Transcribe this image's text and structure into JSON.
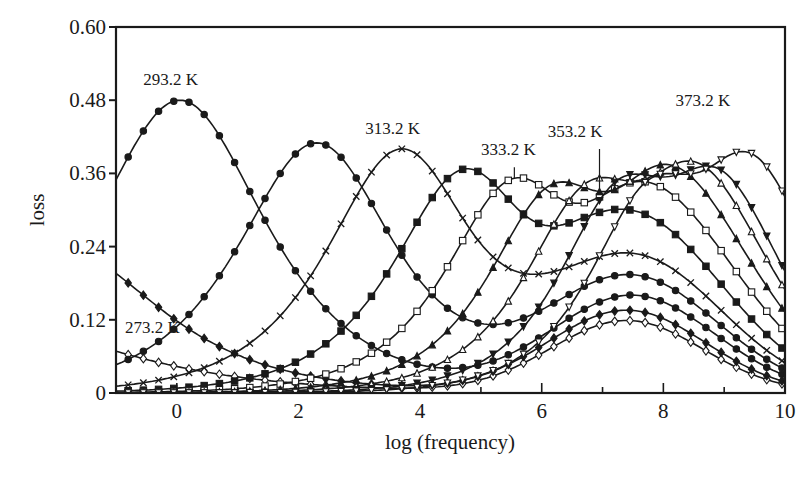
{
  "chart_data": {
    "type": "line",
    "title": "",
    "xlabel": "log (frequency)",
    "ylabel": "loss",
    "xlim": [
      -1,
      10
    ],
    "ylim": [
      0,
      0.6
    ],
    "xticks": [
      0,
      2,
      4,
      6,
      8,
      10
    ],
    "xtick_labels": [
      "0",
      "2",
      "4",
      "6",
      "8",
      "10"
    ],
    "yticks": [
      0,
      0.12,
      0.24,
      0.36,
      0.48,
      0.6
    ],
    "ytick_labels": [
      "0",
      "0.12",
      "0.24",
      "0.36",
      "0.48",
      "0.60"
    ],
    "grid": false,
    "legend": "none (curves labeled inline)",
    "annotations": [
      {
        "text": "273.2 K",
        "x": -0.85,
        "y": 0.098
      },
      {
        "text": "293.2 K",
        "x": -0.55,
        "y": 0.505
      },
      {
        "text": "313.2 K",
        "x": 3.1,
        "y": 0.425
      },
      {
        "text": "333.2 K",
        "x": 5.0,
        "y": 0.39
      },
      {
        "text": "353.2 K",
        "x": 6.1,
        "y": 0.42
      },
      {
        "text": "373.2 K",
        "x": 8.2,
        "y": 0.47
      }
    ],
    "series_model": "each curve = primary relaxation peak (height h1 at log f = p1, width w1) + secondary broad peak (height h2 at log f = p2, width w2); values sampled on x",
    "x": [
      -1,
      -0.5,
      0,
      0.5,
      1,
      1.5,
      2,
      2.5,
      3,
      3.5,
      4,
      4.5,
      5,
      5.5,
      6,
      6.5,
      7,
      7.5,
      8,
      8.5,
      9,
      9.5,
      10
    ],
    "series": [
      {
        "name": "273.2 K",
        "marker": "diamond-open",
        "p1": -3.0,
        "h1": 0.11,
        "w1": 1.9,
        "p2": 7.4,
        "h2": 0.118,
        "w2": 1.25
      },
      {
        "name": "283.2 K",
        "marker": "diamond-filled",
        "p1": -1.9,
        "h1": 0.235,
        "w1": 1.45,
        "p2": 7.4,
        "h2": 0.135,
        "w2": 1.3
      },
      {
        "name": "293.2 K",
        "marker": "circle-filled",
        "p1": 0.05,
        "h1": 0.48,
        "w1": 1.25,
        "p2": 7.5,
        "h2": 0.158,
        "w2": 1.35
      },
      {
        "name": "303.2 K",
        "marker": "hexagon-filled",
        "p1": 2.3,
        "h1": 0.41,
        "w1": 1.15,
        "p2": 7.5,
        "h2": 0.185,
        "w2": 1.4
      },
      {
        "name": "313.2 K",
        "marker": "cross",
        "p1": 3.7,
        "h1": 0.4,
        "w1": 1.1,
        "p2": 7.6,
        "h2": 0.205,
        "w2": 1.4
      },
      {
        "name": "323.2 K",
        "marker": "square-filled",
        "p1": 4.75,
        "h1": 0.365,
        "w1": 1.05,
        "p2": 7.6,
        "h2": 0.255,
        "w2": 1.45
      },
      {
        "name": "333.2 K",
        "marker": "square-open",
        "p1": 5.55,
        "h1": 0.345,
        "w1": 1.0,
        "p2": 7.7,
        "h2": 0.3,
        "w2": 1.5
      },
      {
        "name": "343.2 K",
        "marker": "triangle-filled",
        "p1": 6.2,
        "h1": 0.33,
        "w1": 0.95,
        "p2": 7.8,
        "h2": 0.355,
        "w2": 1.5
      },
      {
        "name": "353.2 K",
        "marker": "triangle-open",
        "p1": 6.8,
        "h1": 0.33,
        "w1": 0.95,
        "p2": 8.0,
        "h2": 0.385,
        "w2": 1.45
      },
      {
        "name": "363.2 K",
        "marker": "triangle-down-filled",
        "p1": 7.3,
        "h1": 0.33,
        "w1": 0.9,
        "p2": 8.2,
        "h2": 0.42,
        "w2": 1.35
      },
      {
        "name": "373.2 K",
        "marker": "triangle-down-open",
        "p1": 7.8,
        "h1": 0.33,
        "w1": 0.9,
        "p2": 8.8,
        "h2": 0.45,
        "w2": 1.3
      }
    ],
    "plot_area_px": {
      "left": 116,
      "right": 785,
      "top": 27,
      "bottom": 393
    },
    "colors": {
      "line": "#1a1a1a",
      "background": "#ffffff"
    }
  }
}
